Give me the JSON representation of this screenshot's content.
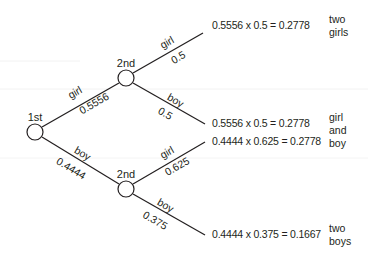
{
  "diagram": {
    "type": "probability-tree",
    "nodes": {
      "first": {
        "label": "1st"
      },
      "second_upper": {
        "label": "2nd"
      },
      "second_lower": {
        "label": "2nd"
      }
    },
    "branches": {
      "first_girl": {
        "outcome": "girl",
        "probability": "0.5556"
      },
      "first_boy": {
        "outcome": "boy",
        "probability": "0.4444"
      },
      "upper_girl": {
        "outcome": "girl",
        "probability": "0.5"
      },
      "upper_boy": {
        "outcome": "boy",
        "probability": "0.5"
      },
      "lower_girl": {
        "outcome": "girl",
        "probability": "0.625"
      },
      "lower_boy": {
        "outcome": "boy",
        "probability": "0.375"
      }
    },
    "results": [
      {
        "calculation": "0.5556 x 0.5 = 0.2778"
      },
      {
        "calculation": "0.5556 x 0.5 = 0.2778"
      },
      {
        "calculation": "0.4444 x 0.625 = 0.2778"
      },
      {
        "calculation": "0.4444 x 0.375 = 0.1667"
      }
    ],
    "outcomes": [
      {
        "line1": "two",
        "line2": "girls"
      },
      {
        "line1": "girl",
        "line2": "and",
        "line3": "boy"
      },
      {
        "line1": "two",
        "line2": "boys"
      }
    ],
    "colors": {
      "line": "#231f20",
      "text": "#231f20",
      "background": "#ffffff",
      "guide": "#f2f2f2"
    }
  }
}
